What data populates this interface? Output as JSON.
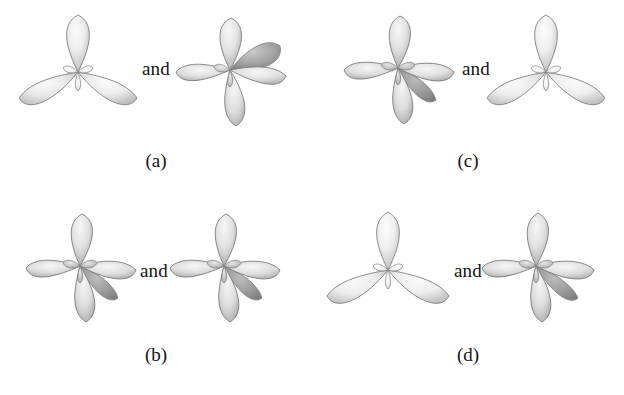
{
  "figure": {
    "background_color": "#ffffff",
    "lobe_fill_light": "#f2f2f2",
    "lobe_fill_mid": "#d8d8d8",
    "lobe_fill_dark": "#9a9a9a",
    "lobe_outline": "#7a7a7a",
    "label_color": "#141414"
  },
  "panels": [
    {
      "id": "a",
      "label": "(a)",
      "conjunction": "and",
      "left_orbital": {
        "name": "sp2-trigonal-orbital-set",
        "lobe_count": 3,
        "orientation": "up-left-right"
      },
      "right_orbital": {
        "name": "sp3-tetrahedral-orbital-set",
        "lobe_count": 4,
        "orientation": "up-left-right-back"
      }
    },
    {
      "id": "b",
      "label": "(b)",
      "conjunction": "and",
      "left_orbital": {
        "name": "sp3-tetrahedral-orbital-set",
        "lobe_count": 4,
        "orientation": "up-left-right-down"
      },
      "right_orbital": {
        "name": "sp3-tetrahedral-orbital-set",
        "lobe_count": 4,
        "orientation": "up-left-right-down"
      }
    },
    {
      "id": "c",
      "label": "(c)",
      "conjunction": "and",
      "left_orbital": {
        "name": "sp3-tetrahedral-orbital-set",
        "lobe_count": 4,
        "orientation": "up-left-right-down"
      },
      "right_orbital": {
        "name": "sp2-trigonal-orbital-set",
        "lobe_count": 3,
        "orientation": "up-left-right"
      }
    },
    {
      "id": "d",
      "label": "(d)",
      "conjunction": "and",
      "left_orbital": {
        "name": "sp2-trigonal-orbital-set",
        "lobe_count": 3,
        "orientation": "up-left-right"
      },
      "right_orbital": {
        "name": "sp3-tetrahedral-orbital-set",
        "lobe_count": 4,
        "orientation": "up-left-right-down"
      }
    }
  ]
}
